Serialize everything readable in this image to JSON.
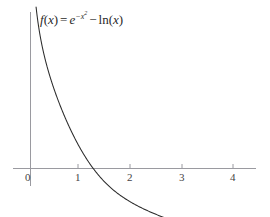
{
  "figure": {
    "background_color": "#ffffff",
    "axis_color": "#9a9aa0",
    "curve_color": "#2b2b2b",
    "text_color": "#2a2a2a"
  },
  "equation": {
    "function_name": "f",
    "argument": "x",
    "equals": "=",
    "exp_base": "e",
    "exp_sign": "−",
    "exp_var": "x",
    "exp_power": "2",
    "minus": "−",
    "ln_name": "ln",
    "ln_arg": "x",
    "open_paren": "(",
    "close_paren": ")",
    "plain_text": "f(x) = e^(-x^2) - ln(x)"
  },
  "axes": {
    "x_tick_labels": [
      "0",
      "1",
      "2",
      "3",
      "4"
    ],
    "x_tick_values": [
      0,
      1,
      2,
      3,
      4
    ],
    "y_tick_labels": [],
    "x_axis_label": "",
    "y_axis_label": ""
  },
  "chart_data": {
    "type": "line",
    "title": "",
    "subtitle": "",
    "xlabel": "",
    "ylabel": "",
    "grid": false,
    "legend": null,
    "annotations": [
      {
        "text": "f(x) = e^(-x^2) - ln(x)",
        "x": 0.25,
        "y": 2.75
      }
    ],
    "xlim": [
      -0.12,
      4.38
    ],
    "ylim": [
      -1.45,
      3.15
    ],
    "x_ticks": [
      0,
      1,
      2,
      3,
      4
    ],
    "y_ticks": [],
    "series": [
      {
        "name": "f(x) = e^(-x^2) - ln(x)",
        "color": "#2b2b2b",
        "x": [
          0.055,
          0.07,
          0.09,
          0.11,
          0.13,
          0.15,
          0.18,
          0.21,
          0.25,
          0.3,
          0.35,
          0.4,
          0.45,
          0.5,
          0.55,
          0.6,
          0.65,
          0.7,
          0.75,
          0.8,
          0.85,
          0.9,
          0.95,
          1.0,
          1.1,
          1.2,
          1.3,
          1.4,
          1.5,
          1.6,
          1.7,
          1.8,
          1.9,
          2.0,
          2.2,
          2.4,
          2.6,
          2.8,
          3.0,
          3.2,
          3.4,
          3.6,
          3.8,
          4.0,
          4.1
        ],
        "y": [
          3.1,
          2.96,
          2.72,
          2.51,
          2.38,
          2.27,
          2.11,
          1.96,
          1.81,
          1.65,
          1.51,
          1.39,
          1.3,
          1.47,
          1.34,
          1.21,
          1.1,
          1.0,
          0.9,
          0.82,
          0.74,
          0.66,
          0.59,
          0.52,
          0.38,
          0.25,
          0.12,
          0.0,
          -0.1,
          -0.2,
          -0.28,
          -0.36,
          -0.43,
          -0.5,
          -0.62,
          -0.73,
          -0.82,
          -0.9,
          -0.98,
          -1.05,
          -1.12,
          -1.18,
          -1.24,
          -1.3,
          -1.33
        ]
      }
    ]
  }
}
